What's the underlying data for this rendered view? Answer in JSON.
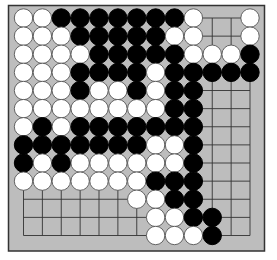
{
  "game": "go",
  "board": {
    "size": 13,
    "colors": {
      "board": "#bdbdbd",
      "border": "#333333",
      "grid": "#333333",
      "black": "#000000",
      "white": "#ffffff",
      "white_outline": "#555555"
    },
    "legend": {
      "B": "black",
      "W": "white",
      ".": "empty"
    },
    "rows": [
      "WWBBBBBBBW..W",
      "WWWBBBBBWW..W",
      "WWWWBBBBBWWWB",
      "WWWBBBBWBBBBB",
      "WWWBWWBWBB...",
      "WWWWWWWWBB...",
      "WBWBBBBBBB...",
      "BBBBBBBWWB...",
      "BWBWWWWWWB...",
      "WWWWWWWBBB...",
      "......WWBB...",
      ".......WWBB..",
      ".......WWWB.."
    ]
  }
}
